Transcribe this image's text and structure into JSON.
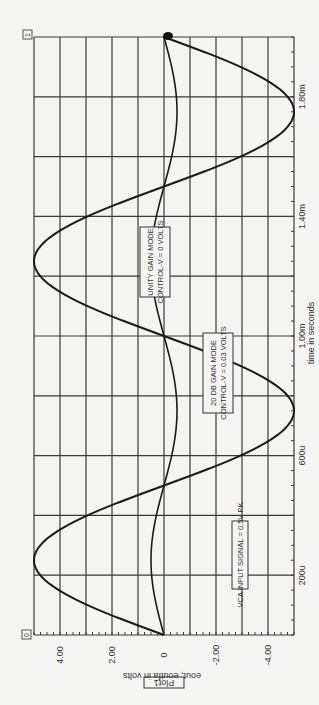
{
  "chart_data": {
    "type": "line",
    "orientation": "rotated-90-clockwise",
    "title": "Plot1",
    "xlabel": "time in seconds",
    "ylabel": "eout, eoutfa in volts",
    "xlim": [
      0,
      0.002
    ],
    "ylim": [
      -5,
      5
    ],
    "x_ticks": [
      {
        "value": 0.0002,
        "label": "200u"
      },
      {
        "value": 0.0006,
        "label": "600u"
      },
      {
        "value": 0.001,
        "label": "1.00m"
      },
      {
        "value": 0.0014,
        "label": "1.40m"
      },
      {
        "value": 0.0018,
        "label": "1.80m"
      }
    ],
    "y_ticks": [
      {
        "value": 4,
        "label": "4.00"
      },
      {
        "value": 2,
        "label": "2.00"
      },
      {
        "value": 0,
        "label": "0"
      },
      {
        "value": -2,
        "label": "-2.00"
      },
      {
        "value": -4,
        "label": "-4.00"
      }
    ],
    "grid": true,
    "grid_x_step": 0.0002,
    "grid_y_step": 1,
    "series": [
      {
        "name": "eout (20 dB gain)",
        "amplitude_v": 5.0,
        "frequency_hz": 1000,
        "x": [
          0,
          0.00025,
          0.0005,
          0.00075,
          0.001,
          0.00125,
          0.0015,
          0.00175,
          0.002
        ],
        "values": [
          0,
          5.0,
          0,
          -5.0,
          0,
          5.0,
          0,
          -5.0,
          0
        ]
      },
      {
        "name": "eoutfa (unity gain)",
        "amplitude_v": 0.5,
        "frequency_hz": 1000,
        "x": [
          0,
          0.00025,
          0.0005,
          0.00075,
          0.001,
          0.00125,
          0.0015,
          0.00175,
          0.002
        ],
        "values": [
          0,
          0.5,
          0,
          -0.5,
          0,
          0.5,
          0,
          -0.5,
          0
        ]
      }
    ],
    "annotations": [
      {
        "lines": [
          "UNITY GAIN MODE",
          "CONTROL-V = 0 VOLTS"
        ]
      },
      {
        "lines": [
          "20 DB GAIN MODE",
          "CONTROL-V = 0.03 VOLTS"
        ]
      },
      {
        "lines": [
          "VCA INPUT SIGNAL = 0.5V PK"
        ]
      }
    ],
    "corner_markers": {
      "start": "0",
      "end": "1"
    }
  },
  "colors": {
    "trace": "#1a1a1a",
    "grid": "#3a3a3a",
    "background": "#f4f4f2"
  }
}
